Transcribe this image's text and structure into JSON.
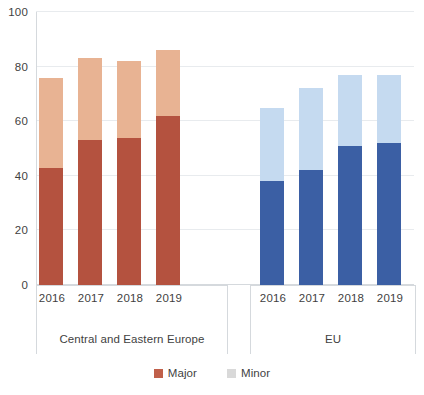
{
  "chart_data": {
    "type": "bar",
    "subtype": "stacked-bar-grouped",
    "title": "",
    "xlabel": "",
    "ylabel": "",
    "ylim": [
      0,
      100
    ],
    "yticks": [
      0,
      20,
      40,
      60,
      80,
      100
    ],
    "ytick_labels": [
      "0",
      "20",
      "40",
      "60",
      "80",
      "100"
    ],
    "grid": true,
    "legend_position": "bottom",
    "categories": [
      "2016",
      "2017",
      "2018",
      "2019"
    ],
    "groups": [
      {
        "name": "Central and Eastern Europe",
        "categories": [
          "2016",
          "2017",
          "2018",
          "2019"
        ],
        "series": [
          {
            "name": "Major",
            "values": [
              43,
              53,
              54,
              62
            ],
            "color": "#B4523F"
          },
          {
            "name": "Minor",
            "values": [
              33,
              30,
              28,
              24
            ],
            "color": "#E8B393"
          }
        ],
        "totals": [
          76,
          83,
          82,
          86
        ]
      },
      {
        "name": "EU",
        "categories": [
          "2016",
          "2017",
          "2018",
          "2019"
        ],
        "series": [
          {
            "name": "Major",
            "values": [
              38,
              42,
              51,
              52
            ],
            "color": "#3B5FA4"
          },
          {
            "name": "Minor",
            "values": [
              27,
              30,
              26,
              25
            ],
            "color": "#C5DAF0"
          }
        ],
        "totals": [
          65,
          72,
          77,
          77
        ]
      }
    ],
    "legend": [
      {
        "label": "Major",
        "color": "#C0604A"
      },
      {
        "label": "Minor",
        "color": "#D9D9D9"
      }
    ]
  },
  "axis": {
    "y_tick_labels": [
      "100",
      "80",
      "60",
      "40",
      "20",
      "0"
    ]
  },
  "groups_display": [
    {
      "label": "Central and Eastern Europe",
      "ticks": [
        "2016",
        "2017",
        "2018",
        "2019"
      ]
    },
    {
      "label": "EU",
      "ticks": [
        "2016",
        "2017",
        "2018",
        "2019"
      ]
    }
  ],
  "colors": {
    "major_cee": "#B4523F",
    "minor_cee": "#E8B393",
    "major_eu": "#3B5FA4",
    "minor_eu": "#C5DAF0",
    "legend_major": "#C0604A",
    "legend_minor": "#D9D9D9",
    "gridline": "#E8EBEE",
    "axis": "#D5D9DD",
    "text": "#3F3F3F",
    "background": "#FFFFFF"
  }
}
